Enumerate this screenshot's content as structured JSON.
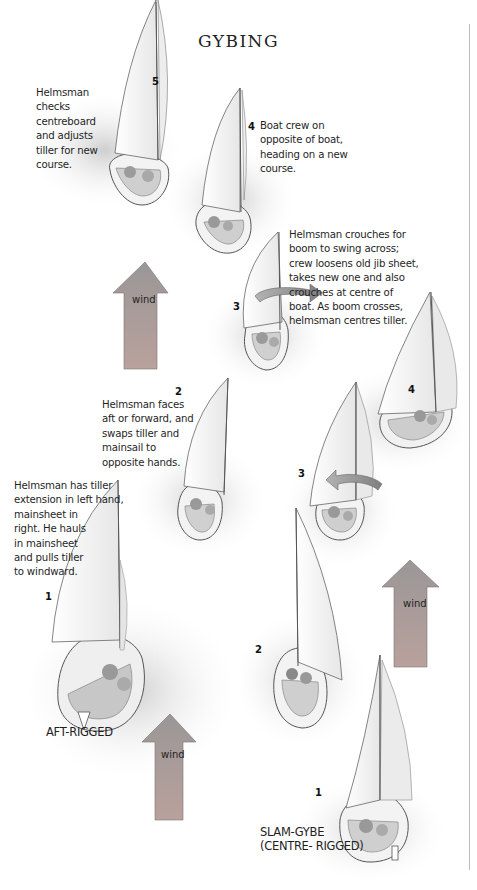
{
  "title": "GYBING",
  "colors": {
    "wind_arrow_top": "#9a9797",
    "wind_arrow_bottom": "#b69d98",
    "water_shadow": "#d9d9d9",
    "sail": "#ffffff",
    "hull_outline": "#555555",
    "divider": "#bdbdbd"
  },
  "sequences": {
    "aft_rigged": {
      "label": "AFT-RIGGED",
      "steps": [
        {
          "num": "1",
          "caption": [
            "Helmsman has tiller",
            "extension in left hand,",
            "mainsheet in",
            "right. He hauls",
            "in mainsheet",
            "and pulls tiller",
            "to windward."
          ]
        },
        {
          "num": "2",
          "caption": [
            "Helmsman faces",
            "aft or forward, and",
            "swaps tiller and",
            "mainsail to",
            "opposite hands."
          ]
        },
        {
          "num": "3",
          "caption": [
            "Helmsman crouches for",
            "boom to swing across;",
            "crew loosens old jib sheet,",
            "takes new one and also",
            "crouches at centre of",
            "boat. As boom crosses,",
            "helmsman centres tiller."
          ]
        },
        {
          "num": "4",
          "caption": [
            "Boat crew on",
            "opposite of boat,",
            "heading on a new",
            "course."
          ]
        },
        {
          "num": "5",
          "caption": [
            "Helmsman",
            "checks",
            "centreboard",
            "and adjusts",
            "tiller for new",
            "course."
          ]
        }
      ]
    },
    "slam_gybe": {
      "label_line1": "SLAM-GYBE",
      "label_line2": "(CENTRE- RIGGED)",
      "steps": [
        {
          "num": "1"
        },
        {
          "num": "2"
        },
        {
          "num": "3"
        },
        {
          "num": "4"
        }
      ]
    }
  },
  "wind_arrows": [
    {
      "label": "wind"
    },
    {
      "label": "wind"
    },
    {
      "label": "wind"
    }
  ]
}
